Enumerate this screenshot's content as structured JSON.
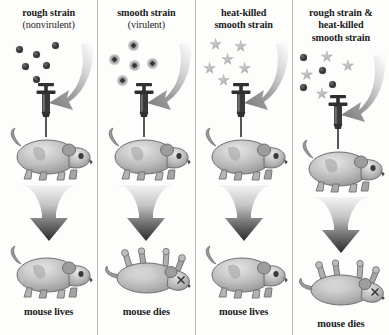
{
  "figure": {
    "background_color": "#fdfdfc",
    "divider_color": "#b9b9b7",
    "text_color": "#1c1c1c",
    "bacteria_dark_color": "#3a3a3a",
    "bacteria_star_color": "#a9a9a9",
    "arrow_color": "#8f8f8f"
  },
  "columns": [
    {
      "header_lines": [
        "rough strain",
        "(nonvirulent)"
      ],
      "header_plain_index": 1,
      "bacteria_type": "dot",
      "bacteria_label": "rough-nonvirulent-bacteria",
      "bacteria_count": 6,
      "bacteria": [
        {
          "kind": "dot",
          "x": 16,
          "y": 12
        },
        {
          "kind": "dot",
          "x": 33,
          "y": 17
        },
        {
          "kind": "dot",
          "x": 52,
          "y": 8
        },
        {
          "kind": "dot",
          "x": 22,
          "y": 29
        },
        {
          "kind": "dot",
          "x": 43,
          "y": 28
        },
        {
          "kind": "dot",
          "x": 33,
          "y": 42
        }
      ],
      "top_mouse_state": "alive",
      "bottom_mouse_state": "alive",
      "outcome": "mouse lives"
    },
    {
      "header_lines": [
        "smooth strain",
        "(virulent)"
      ],
      "header_plain_index": 1,
      "bacteria_type": "capsule",
      "bacteria_label": "smooth-virulent-bacteria",
      "bacteria_count": 5,
      "bacteria": [
        {
          "kind": "capsule",
          "x": 30,
          "y": 6
        },
        {
          "kind": "capsule",
          "x": 11,
          "y": 20
        },
        {
          "kind": "capsule",
          "x": 31,
          "y": 26
        },
        {
          "kind": "capsule",
          "x": 49,
          "y": 24
        },
        {
          "kind": "capsule",
          "x": 19,
          "y": 41
        }
      ],
      "top_mouse_state": "alive",
      "bottom_mouse_state": "dead",
      "outcome": "mouse dies"
    },
    {
      "header_lines": [
        "heat-killed",
        "smooth strain"
      ],
      "header_plain_index": -1,
      "bacteria_type": "star",
      "bacteria_label": "heat-killed-smooth-bacteria",
      "bacteria_count": 6,
      "bacteria": [
        {
          "kind": "star",
          "x": 14,
          "y": 4
        },
        {
          "kind": "star",
          "x": 39,
          "y": 6
        },
        {
          "kind": "star",
          "x": 26,
          "y": 19
        },
        {
          "kind": "star",
          "x": 8,
          "y": 28
        },
        {
          "kind": "star",
          "x": 43,
          "y": 28
        },
        {
          "kind": "star",
          "x": 22,
          "y": 40
        }
      ],
      "top_mouse_state": "alive",
      "bottom_mouse_state": "alive",
      "outcome": "mouse lives"
    },
    {
      "header_lines": [
        "rough strain &",
        "heat-killed",
        "smooth strain"
      ],
      "header_plain_index": -1,
      "bacteria_type": "mixed",
      "bacteria_label": "rough-plus-heat-killed-smooth-bacteria",
      "bacteria_count": 8,
      "bacteria": [
        {
          "kind": "dot",
          "x": 8,
          "y": 8
        },
        {
          "kind": "star",
          "x": 28,
          "y": 4
        },
        {
          "kind": "star",
          "x": 49,
          "y": 13
        },
        {
          "kind": "star",
          "x": 8,
          "y": 22
        },
        {
          "kind": "dot",
          "x": 27,
          "y": 21
        },
        {
          "kind": "dot",
          "x": 8,
          "y": 38
        },
        {
          "kind": "dot",
          "x": 37,
          "y": 35
        },
        {
          "kind": "star",
          "x": 23,
          "y": 41
        }
      ],
      "top_mouse_state": "alive",
      "bottom_mouse_state": "dead",
      "outcome": "mouse dies"
    }
  ]
}
